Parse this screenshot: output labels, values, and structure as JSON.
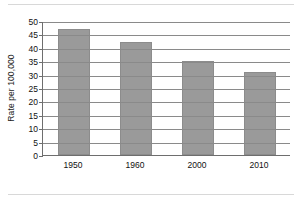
{
  "chart_data": {
    "type": "bar",
    "title": "",
    "xlabel": "",
    "ylabel": "Rate per 100,000",
    "categories": [
      "1950",
      "1960",
      "2000",
      "2010"
    ],
    "values": [
      47,
      42,
      35,
      31
    ],
    "ylim": [
      0,
      50
    ],
    "ytick_step": 5,
    "yticks": [
      "0",
      "5",
      "10",
      "15",
      "20",
      "25",
      "30",
      "35",
      "40",
      "45",
      "50"
    ],
    "grid": true,
    "grid_axis": "y",
    "legend": false,
    "bar_color": "#9a9a9a",
    "bar_border_color": "#8c8c8c",
    "gridline_color": "#8a8a8a",
    "axis_color": "#6e6e6e",
    "background_color": "#ffffff",
    "text_color": "#111111"
  }
}
